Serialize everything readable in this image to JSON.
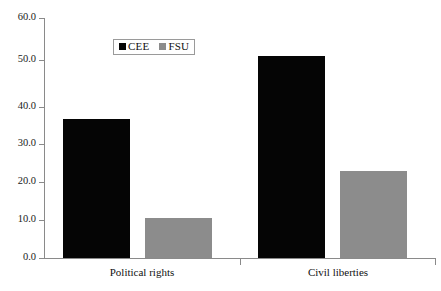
{
  "chart_data": {
    "type": "bar",
    "title": "",
    "subtitle": "",
    "xlabel": "",
    "ylabel": "",
    "categories": [
      "Political rights",
      "Civil liberties"
    ],
    "series": [
      {
        "name": "CEE",
        "color": "#050505",
        "values": [
          34.7,
          50.6
        ]
      },
      {
        "name": "FSU",
        "color": "#8c8c8c",
        "values": [
          10.0,
          21.8
        ]
      }
    ],
    "ylim": [
      0.0,
      60.0
    ],
    "ytick_step": 10.0,
    "yticks": [
      "0.0",
      "10.0",
      "20.0",
      "30.0",
      "40.0",
      "50.0",
      "60.0"
    ],
    "ytick_values": [
      0.0,
      10.0,
      20.0,
      30.0,
      40.0,
      50.0,
      60.0
    ],
    "grid": false,
    "legend_position": "top-center-left",
    "legend": [
      {
        "label": "CEE",
        "swatch": "black-square"
      },
      {
        "label": "FSU",
        "swatch": "gray-square"
      }
    ]
  },
  "axis": {
    "line_color": "#8a8a8a",
    "text_color": "#111111"
  }
}
